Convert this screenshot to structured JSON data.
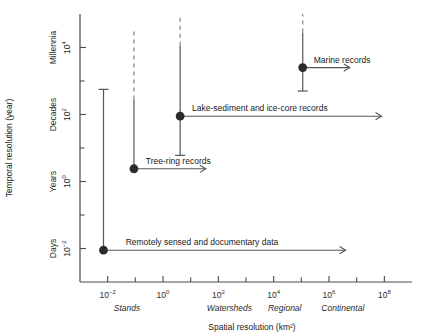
{
  "chart_data": {
    "type": "scatter",
    "title": "",
    "xlabel": "Spatial resolution (km²)",
    "ylabel": "Temporal resolution (year)",
    "xscale": "log",
    "yscale": "log",
    "xlim": [
      -3,
      9
    ],
    "ylim": [
      -3,
      5
    ],
    "grid": false,
    "legend": "none",
    "x_ticks": [
      {
        "exp": -2,
        "base": "10",
        "sup": "−2",
        "label": "10⁻²"
      },
      {
        "exp": 0,
        "base": "10",
        "sup": "0",
        "label": "10⁰"
      },
      {
        "exp": 2,
        "base": "10",
        "sup": "2",
        "label": "10²"
      },
      {
        "exp": 4,
        "base": "10",
        "sup": "4",
        "label": "10⁴"
      },
      {
        "exp": 6,
        "base": "10",
        "sup": "6",
        "label": "10⁶"
      },
      {
        "exp": 8,
        "base": "10",
        "sup": "8",
        "label": "10⁸"
      }
    ],
    "x_minor_ticks": [
      -1,
      1,
      3,
      5,
      7
    ],
    "x_zones": [
      {
        "label": "Stands",
        "exp": -1.3
      },
      {
        "label": "Watersheds",
        "exp": 2.4
      },
      {
        "label": "Regional",
        "exp": 4.4
      },
      {
        "label": "Continental",
        "exp": 6.5
      }
    ],
    "y_ticks": [
      {
        "exp": -2,
        "base": "10",
        "sup": "−2",
        "label": "10⁻²",
        "category": "Days"
      },
      {
        "exp": 0,
        "base": "10",
        "sup": "0",
        "label": "10⁰",
        "category": "Years"
      },
      {
        "exp": 2,
        "base": "10",
        "sup": "2",
        "label": "10²",
        "category": "Decades"
      },
      {
        "exp": 4,
        "base": "10",
        "sup": "4",
        "label": "10⁴",
        "category": "Millennia"
      }
    ],
    "y_minor_ticks": [
      -1,
      1,
      3
    ],
    "series": [
      {
        "name": "Remotely sensed and documentary data",
        "x_exp": -2.15,
        "y_exp": -2.05,
        "bar_bottom_exp": -2.05,
        "bar_top_exp": 2.75,
        "bar_dashed_from_exp": null,
        "top_cap": true,
        "bottom_cap": false,
        "arrow_to_exp": 6.6,
        "label_x_exp": -1.35,
        "label_above": true
      },
      {
        "name": "Tree-ring records",
        "x_exp": -1.05,
        "y_exp": 0.38,
        "bar_bottom_exp": 0.38,
        "bar_top_exp": 4.55,
        "bar_dashed_from_exp": 2.45,
        "top_cap": false,
        "bottom_cap": false,
        "arrow_to_exp": 1.55,
        "label_x_exp": -0.62,
        "label_above": true
      },
      {
        "name": "Lake-sediment and ice-core records",
        "x_exp": 0.62,
        "y_exp": 1.95,
        "bar_bottom_exp": 0.78,
        "bar_top_exp": 5.0,
        "bar_dashed_from_exp": 4.05,
        "top_cap": false,
        "bottom_cap": true,
        "arrow_to_exp": 7.9,
        "label_x_exp": 1.05,
        "label_above": true
      },
      {
        "name": "Marine records",
        "x_exp": 5.05,
        "y_exp": 3.4,
        "bar_bottom_exp": 2.7,
        "bar_top_exp": 5.0,
        "bar_dashed_from_exp": 4.45,
        "top_cap": false,
        "bottom_cap": true,
        "arrow_to_exp": 6.75,
        "label_x_exp": 5.45,
        "label_above": true
      }
    ]
  },
  "colors": {
    "axis": "#4a4a4a",
    "marker": "#2b2b2b",
    "bar": "#555555",
    "dashed": "#8a8a8a",
    "text": "#1a1a1a",
    "background": "#ffffff"
  }
}
